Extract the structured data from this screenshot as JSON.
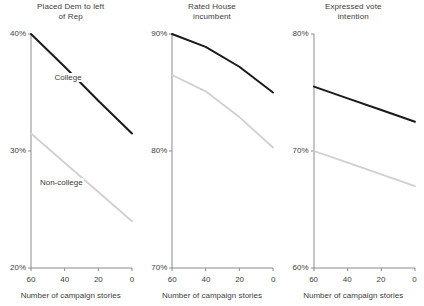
{
  "figure": {
    "xlabel": "Number of campaign stories",
    "series_names": [
      "College",
      "Non-college"
    ],
    "colors": {
      "college": "#1a1a1a",
      "non_college": "#d0d0d0",
      "axis": "#8c8c8c",
      "text": "#3d3d3d"
    }
  },
  "chart_data": [
    {
      "type": "line",
      "title": "Placed Dem to left\nof Rep",
      "title_line1": "Placed Dem to left",
      "title_line2": "of Rep",
      "xlabel": "Number of campaign stories",
      "ylabel": "",
      "xlim": [
        60,
        0
      ],
      "ylim": [
        20,
        40
      ],
      "x_ticks": [
        60,
        40,
        20,
        0
      ],
      "x_tick_labels": [
        "60",
        "40",
        "20",
        "0"
      ],
      "y_ticks": [
        20,
        30,
        40
      ],
      "y_tick_labels": [
        "20%",
        "30%",
        "40%"
      ],
      "grid": false,
      "legend": "inline-annotations",
      "series": [
        {
          "name": "College",
          "color": "#1a1a1a",
          "x": [
            60,
            40,
            20,
            0
          ],
          "values": [
            40.0,
            37.2,
            34.3,
            31.5
          ]
        },
        {
          "name": "Non-college",
          "color": "#d0d0d0",
          "x": [
            60,
            40,
            20,
            0
          ],
          "values": [
            31.5,
            29.0,
            26.5,
            24.0
          ]
        }
      ],
      "annotations": [
        {
          "text": "College",
          "x": 38,
          "y": 36.2
        },
        {
          "text": "Non-college",
          "x": 42,
          "y": 27.3
        }
      ]
    },
    {
      "type": "line",
      "title": "Rated House\nincumbent",
      "title_line1": "Rated House",
      "title_line2": "incumbent",
      "xlabel": "Number of campaign stories",
      "ylabel": "",
      "xlim": [
        60,
        0
      ],
      "ylim": [
        70,
        90
      ],
      "x_ticks": [
        60,
        40,
        20,
        0
      ],
      "x_tick_labels": [
        "60",
        "40",
        "20",
        "0"
      ],
      "y_ticks": [
        70,
        80,
        90
      ],
      "y_tick_labels": [
        "70%",
        "80%",
        "90%"
      ],
      "grid": false,
      "legend": "none",
      "series": [
        {
          "name": "College",
          "color": "#1a1a1a",
          "x": [
            60,
            40,
            20,
            0
          ],
          "values": [
            90.0,
            88.9,
            87.2,
            85.0
          ]
        },
        {
          "name": "Non-college",
          "color": "#d0d0d0",
          "x": [
            60,
            40,
            20,
            0
          ],
          "values": [
            86.5,
            85.1,
            82.9,
            80.3
          ]
        }
      ],
      "annotations": []
    },
    {
      "type": "line",
      "title": "Expressed vote\nintention",
      "title_line1": "Expressed vote",
      "title_line2": "intention",
      "xlabel": "Number of campaign stories",
      "ylabel": "",
      "xlim": [
        60,
        0
      ],
      "ylim": [
        60,
        80
      ],
      "x_ticks": [
        60,
        40,
        20,
        0
      ],
      "x_tick_labels": [
        "60",
        "40",
        "20",
        "0"
      ],
      "y_ticks": [
        60,
        70,
        80
      ],
      "y_tick_labels": [
        "60%",
        "70%",
        "80%"
      ],
      "grid": false,
      "legend": "none",
      "series": [
        {
          "name": "College",
          "color": "#1a1a1a",
          "x": [
            60,
            40,
            20,
            0
          ],
          "values": [
            75.5,
            74.5,
            73.5,
            72.5
          ]
        },
        {
          "name": "Non-college",
          "color": "#d0d0d0",
          "x": [
            60,
            40,
            20,
            0
          ],
          "values": [
            70.0,
            69.0,
            68.0,
            67.0
          ]
        }
      ],
      "annotations": []
    }
  ]
}
